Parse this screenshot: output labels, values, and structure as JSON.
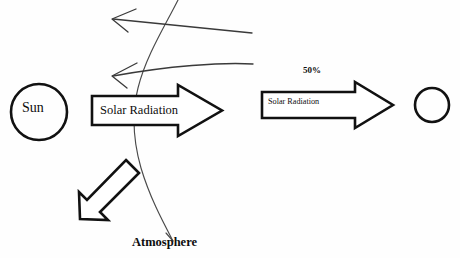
{
  "diagram": {
    "background_color": "#fefefe",
    "ink_color": "#111111",
    "pencil_color": "#3a3a3a",
    "labels": {
      "sun": "Sun",
      "solar_radiation_main": "Solar Radiation",
      "solar_radiation_second": "Solar Radiation",
      "percent": "50%",
      "atmosphere": "Atmosphere"
    },
    "shapes": {
      "sun_circle": {
        "name": "sun-circle",
        "cx": 39,
        "cy": 112,
        "r": 28
      },
      "earth_circle": {
        "name": "earth-circle",
        "cx": 432,
        "cy": 105,
        "r": 17
      },
      "main_arrow": {
        "name": "main-solar-radiation-arrow",
        "direction": "right",
        "body_x": 92,
        "body_y": 96,
        "body_w": 86,
        "body_h": 29,
        "tip_x": 222,
        "head_top": 85,
        "head_bottom": 136
      },
      "second_arrow": {
        "name": "second-solar-radiation-arrow",
        "direction": "right",
        "body_x": 262,
        "body_y": 92,
        "body_w": 93,
        "body_h": 26,
        "tip_x": 393,
        "head_top": 82,
        "head_bottom": 128
      },
      "reflected_arrow": {
        "name": "reflected-radiation-arrow",
        "direction": "down-left",
        "from_x": 133,
        "from_y": 166,
        "to_x": 80,
        "to_y": 219
      }
    },
    "sketch_lines": [
      {
        "name": "upper-reflected-ray",
        "direction": "left",
        "from_x": 252,
        "from_y": 33,
        "to_x": 113,
        "to_y": 19
      },
      {
        "name": "lower-reflected-ray",
        "direction": "left",
        "from_x": 253,
        "from_y": 64,
        "to_x": 113,
        "to_y": 76
      },
      {
        "name": "atmosphere-boundary-curve",
        "top_x": 178,
        "top_y": 0,
        "mid_x": 136,
        "mid_y": 105,
        "bottom_x": 173,
        "bottom_y": 241
      }
    ]
  }
}
